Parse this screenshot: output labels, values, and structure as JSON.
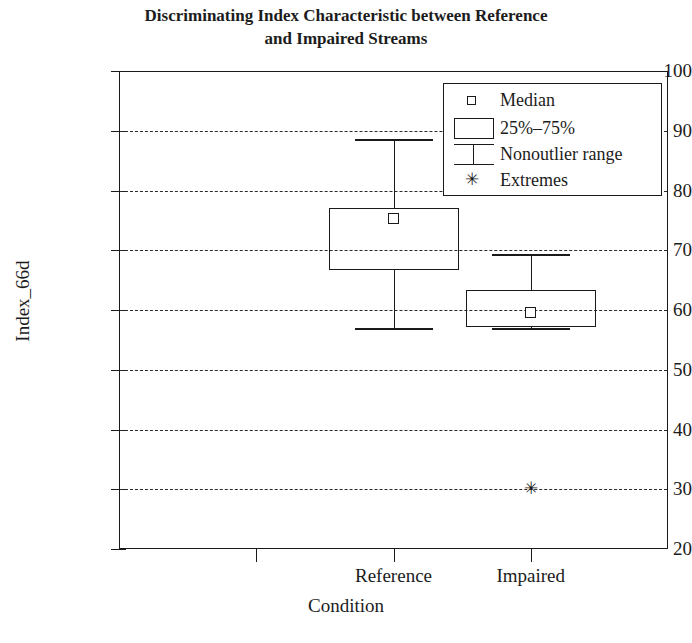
{
  "chart_data": {
    "type": "box",
    "title": "Discriminating Index Characteristic between Reference and Impaired Streams",
    "title_line1": "Discriminating Index Characteristic between Reference",
    "title_line2": "and Impaired Streams",
    "xlabel": "Condition",
    "ylabel": "Index_66d",
    "categories": [
      "Reference",
      "Impaired"
    ],
    "ylim": [
      20,
      100
    ],
    "ytick_labels": [
      "100",
      "90",
      "80",
      "70",
      "60",
      "50",
      "40",
      "30",
      "20"
    ],
    "yticks": [
      100,
      90,
      80,
      70,
      60,
      50,
      40,
      30,
      20
    ],
    "gridlines": [
      90,
      80,
      70,
      60,
      50,
      40,
      30
    ],
    "grid": true,
    "legend_position": "top-right",
    "boxes": [
      {
        "category": "Reference",
        "whisker_low": 57.0,
        "q1": 66.7,
        "median": 75.3,
        "q3": 77.0,
        "whisker_high": 88.6,
        "extremes": []
      },
      {
        "category": "Impaired",
        "whisker_low": 57.0,
        "q1": 57.2,
        "median": 59.6,
        "q3": 63.4,
        "whisker_high": 69.4,
        "extremes": [
          30.0
        ]
      }
    ],
    "legend": [
      {
        "label": "Median",
        "symbol": "small-square"
      },
      {
        "label": "25%–75%",
        "symbol": "rectangle"
      },
      {
        "label": "Nonoutlier range",
        "symbol": "i-bar"
      },
      {
        "label": "Extremes",
        "symbol": "asterisk"
      }
    ],
    "extreme_glyph": "✳",
    "colors": {
      "line": "#1a1a1a",
      "grid": "#2a2a2a",
      "background": "#ffffff",
      "text": "#1c1c1c"
    }
  }
}
